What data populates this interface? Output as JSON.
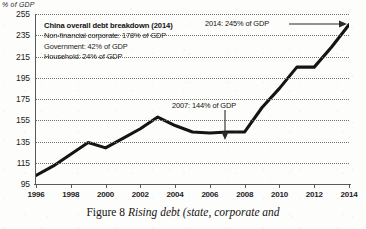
{
  "axis_title": "% of GDP",
  "caption": {
    "lead": "Figure 8 ",
    "italic": "Rising debt (state, corporate and"
  },
  "legend": {
    "title": "China overall debt breakdown (2014)",
    "lines": [
      "Non-financial corporate: 178% of GDP",
      "Government: 42% of GDP",
      "Household: 24% of GDP"
    ]
  },
  "annotations": [
    {
      "id": "ann-2014",
      "text": "2014: 245% of GDP"
    },
    {
      "id": "ann-2007",
      "text": "2007: 144% of GDP"
    }
  ],
  "colors": {
    "line": "#141414",
    "grid": "#6f6f6f",
    "axis": "#5a5a5a",
    "text": "#1c1c1c",
    "background": "#fdfdfc"
  },
  "chart_data": {
    "type": "line",
    "title": "",
    "subtitle": "",
    "xlabel": "",
    "ylabel": "% of GDP",
    "xlim": [
      1996,
      2014
    ],
    "ylim": [
      95,
      255
    ],
    "ytick_step": 20,
    "xtick_step": 2,
    "grid": true,
    "gridlines_style": "dotted horizontal",
    "legend_position": "upper-left (text box, no swatches)",
    "ytick_labels": [
      "95",
      "115",
      "135",
      "155",
      "175",
      "195",
      "215",
      "235",
      "255"
    ],
    "ytick_values": [
      95,
      115,
      135,
      155,
      175,
      195,
      215,
      235,
      255
    ],
    "xtick_labels": [
      "1996",
      "1998",
      "2000",
      "2002",
      "2004",
      "2006",
      "2008",
      "2010",
      "2012",
      "2014"
    ],
    "xtick_values": [
      1996,
      1998,
      2000,
      2002,
      2004,
      2006,
      2008,
      2010,
      2012,
      2014
    ],
    "series": [
      {
        "name": "China overall debt (% of GDP)",
        "x": [
          1996,
          1997,
          1998,
          1999,
          2000,
          2001,
          2002,
          2003,
          2004,
          2005,
          2006,
          2007,
          2008,
          2009,
          2010,
          2011,
          2012,
          2013,
          2014
        ],
        "values": [
          103,
          112,
          123,
          134,
          129,
          138,
          147,
          158,
          150,
          144,
          143,
          144,
          144,
          167,
          185,
          205,
          205,
          224,
          245
        ]
      }
    ],
    "data_labels": [
      {
        "x": 2007,
        "y": 144,
        "text": "2007: 144% of GDP"
      },
      {
        "x": 2014,
        "y": 245,
        "text": "2014: 245% of GDP"
      }
    ]
  }
}
